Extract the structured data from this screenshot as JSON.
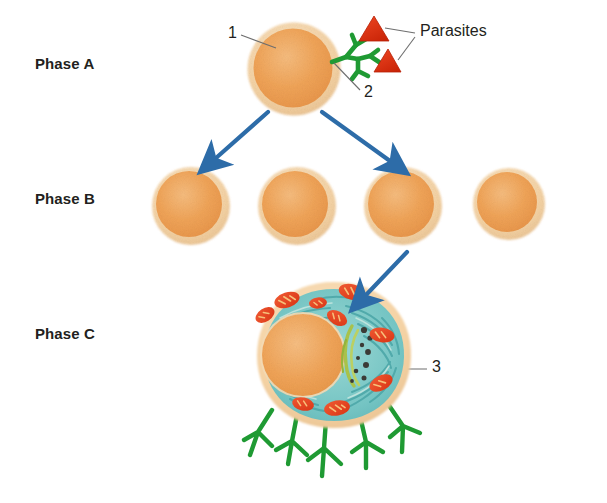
{
  "figure": {
    "type": "biological-diagram",
    "background_color": "#ffffff"
  },
  "phases": [
    {
      "id": "A",
      "label": "Phase A",
      "x": 35,
      "y": 55,
      "cell_count": 1
    },
    {
      "id": "B",
      "label": "Phase B",
      "x": 35,
      "y": 190,
      "cell_count": 4
    },
    {
      "id": "C",
      "label": "Phase C",
      "x": 35,
      "y": 325,
      "cell_count": 1
    }
  ],
  "callouts": [
    {
      "id": "1",
      "label": "1",
      "x": 228,
      "y": 26,
      "describes": "cell-membrane-of-phase-a-cell"
    },
    {
      "id": "2",
      "label": "2",
      "x": 364,
      "y": 84,
      "describes": "green-receptor-branch"
    },
    {
      "id": "3",
      "label": "3",
      "x": 432,
      "y": 359,
      "describes": "differentiated-cell-cytoplasm"
    }
  ],
  "annotations": {
    "parasites_label": "Parasites",
    "parasites_label_x": 420,
    "parasites_label_y": 22
  },
  "colors": {
    "cell_fill": "#F0A055",
    "cell_fill_light": "#F4B272",
    "cell_rim": "#F6D6AC",
    "cell_rim_outer": "#EFCB9A",
    "arrow_blue": "#2D6CA8",
    "parasite_red": "#DE3316",
    "parasite_red_dark": "#C32208",
    "receptor_green": "#1F9A33",
    "receptor_green_dark": "#157A26",
    "cytoplasm_teal": "#63BFC0",
    "cytoplasm_teal_light": "#95D5D3",
    "mitochondria_red": "#E8482A",
    "mitochondria_inner": "#F5B25A",
    "golgi_green": "#A8C24A",
    "granule_dark": "#3B3B36",
    "leader_line": "#6E6E6E",
    "text": "#231f20"
  },
  "phase_a_cell": {
    "cx": 294,
    "cy": 69,
    "r": 46,
    "rim_width": 7
  },
  "phase_b_cells": [
    {
      "cx": 191,
      "cy": 205,
      "r": 38
    },
    {
      "cx": 297,
      "cy": 205,
      "r": 38
    },
    {
      "cx": 403,
      "cy": 205,
      "r": 38
    },
    {
      "cx": 506,
      "cy": 205,
      "r": 34
    }
  ],
  "phase_c_cell": {
    "cx": 334,
    "cy": 355,
    "rx": 76,
    "ry": 72,
    "nucleus_cx": 303,
    "nucleus_cy": 355,
    "nucleus_r": 42,
    "mitochondria_count": 9,
    "receptor_count": 5
  },
  "parasites": [
    {
      "x": 375,
      "y": 20,
      "size": 24
    },
    {
      "x": 388,
      "y": 52,
      "size": 22
    }
  ],
  "arrows": [
    {
      "from": "phase-a-cell",
      "to": "phase-b-cell-1",
      "x1": 268,
      "y1": 113,
      "x2": 214,
      "y2": 160
    },
    {
      "from": "phase-a-cell",
      "to": "phase-b-cell-3",
      "x1": 324,
      "y1": 113,
      "x2": 392,
      "y2": 163
    },
    {
      "from": "phase-b-cell-3",
      "to": "phase-c-cell",
      "x1": 406,
      "y1": 254,
      "x2": 364,
      "y2": 297
    }
  ],
  "leader_lines": [
    {
      "for": "1",
      "x1": 243,
      "y1": 35,
      "x2": 272,
      "y2": 46
    },
    {
      "for": "2",
      "x1": 360,
      "y1": 91,
      "x2": 333,
      "y2": 62
    },
    {
      "for": "Parasites-upper",
      "x1": 416,
      "y1": 34,
      "x2": 383,
      "y2": 27
    },
    {
      "for": "Parasites-lower",
      "x1": 416,
      "y1": 38,
      "x2": 396,
      "y2": 61
    },
    {
      "for": "3",
      "x1": 427,
      "y1": 368,
      "x2": 384,
      "y2": 368
    }
  ]
}
